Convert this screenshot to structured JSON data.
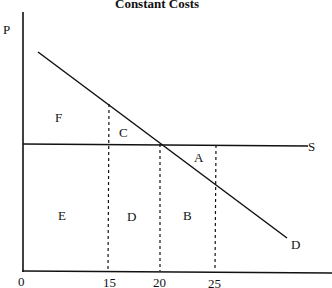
{
  "title": "Constant Costs",
  "axes": {
    "y_label": "P",
    "x_ticks": [
      "0",
      "15",
      "20",
      "25"
    ]
  },
  "curves": {
    "supply_label": "S",
    "demand_label": "D"
  },
  "regions": {
    "a": "A",
    "b": "B",
    "c": "C",
    "d": "D",
    "e": "E",
    "f": "F"
  },
  "colors": {
    "line": "#111111",
    "background": "#ffffff"
  }
}
